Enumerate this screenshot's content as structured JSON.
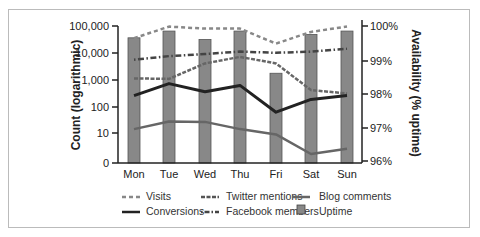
{
  "chart_data": {
    "type": "bar+line",
    "title": "",
    "categories": [
      "Mon",
      "Tue",
      "Wed",
      "Thu",
      "Fri",
      "Sat",
      "Sun"
    ],
    "left_axis": {
      "label": "Count (logarithmic)",
      "scale": "log",
      "ticks": [
        "0",
        "10",
        "100",
        "1,000",
        "10,000",
        "100,000"
      ]
    },
    "right_axis": {
      "label": "Availability (% uptime)",
      "ticks": [
        "96%",
        "97%",
        "98%",
        "99%",
        "100%"
      ],
      "range": [
        96,
        100
      ]
    },
    "bar_series": {
      "name": "Uptime",
      "axis": "right",
      "values": [
        99.65,
        99.85,
        99.6,
        99.85,
        98.6,
        99.75,
        99.85
      ],
      "color": "#888888"
    },
    "series": [
      {
        "name": "Visits",
        "axis": "left",
        "style": "dotted",
        "color": "#888888",
        "values": [
          35000,
          95000,
          80000,
          80000,
          22000,
          60000,
          95000
        ]
      },
      {
        "name": "Twitter mentions",
        "axis": "left",
        "style": "dashed",
        "color": "#666666",
        "values": [
          1100,
          1050,
          4000,
          7000,
          4000,
          400,
          300
        ]
      },
      {
        "name": "Blog comments",
        "axis": "left",
        "style": "solid-thin",
        "color": "#666666",
        "values": [
          14,
          27,
          26,
          14,
          9,
          2,
          3
        ]
      },
      {
        "name": "Conversions",
        "axis": "left",
        "style": "solid-thick",
        "color": "#222222",
        "values": [
          250,
          700,
          350,
          600,
          60,
          180,
          250
        ]
      },
      {
        "name": "Facebook members",
        "axis": "left",
        "style": "dash-dot",
        "color": "#444444",
        "values": [
          5500,
          7500,
          9000,
          11000,
          10000,
          11000,
          14000
        ]
      }
    ],
    "legend_position": "bottom",
    "grid": false
  },
  "ui": {
    "y_left_ticks": [
      {
        "label": "100,000",
        "y": 26
      },
      {
        "label": "10,000",
        "y": 53
      },
      {
        "label": "1,000",
        "y": 80
      },
      {
        "label": "100",
        "y": 107
      },
      {
        "label": "10",
        "y": 133
      },
      {
        "label": "0",
        "y": 163
      }
    ],
    "y_right_ticks": [
      {
        "label": "100%",
        "y": 26
      },
      {
        "label": "99%",
        "y": 61
      },
      {
        "label": "98%",
        "y": 94
      },
      {
        "label": "97%",
        "y": 128
      },
      {
        "label": "96%",
        "y": 161
      }
    ],
    "legend": {
      "visits": "Visits",
      "conversions": "Conversions",
      "twitter": "Twitter mentions",
      "facebook": "Facebook members",
      "blog": "Blog comments",
      "uptime": "Uptime"
    }
  }
}
